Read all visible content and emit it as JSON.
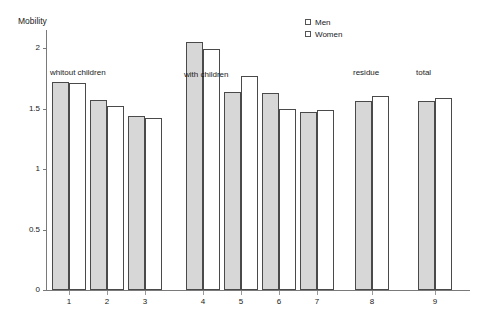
{
  "chart_data": {
    "type": "bar",
    "title": "",
    "ylabel": "Mobility",
    "xlabel": "",
    "ylim": [
      0,
      2.2
    ],
    "grid": false,
    "legend_position": "top-right",
    "categories": [
      "1",
      "2",
      "3",
      "4",
      "5",
      "6",
      "7",
      "8",
      "9"
    ],
    "y_ticks": [
      "0",
      "0.5",
      "1",
      "1.5",
      "2"
    ],
    "y_tick_values": [
      0,
      0.5,
      1,
      1.5,
      2
    ],
    "series": [
      {
        "name": "Men",
        "color": "#d7d7d7",
        "values": [
          1.72,
          1.57,
          1.44,
          2.05,
          1.64,
          1.63,
          1.47,
          1.56,
          1.56
        ]
      },
      {
        "name": "Women",
        "color": "#ffffff",
        "values": [
          1.71,
          1.52,
          1.42,
          1.99,
          1.77,
          1.5,
          1.49,
          1.6,
          1.59
        ]
      }
    ],
    "annotations": [
      {
        "text": "whitout children",
        "group_span": [
          1,
          3
        ]
      },
      {
        "text": "with children",
        "group_span": [
          4,
          7
        ]
      },
      {
        "text": "residue",
        "group_span": [
          8,
          8
        ]
      },
      {
        "text": "total",
        "group_span": [
          9,
          9
        ]
      }
    ]
  },
  "legend": {
    "items": [
      {
        "label": "Men"
      },
      {
        "label": "Women"
      }
    ]
  }
}
